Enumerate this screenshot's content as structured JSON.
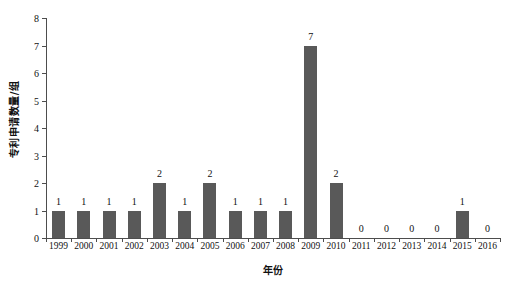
{
  "chart_data": {
    "type": "bar",
    "title": "",
    "xlabel": "年份",
    "ylabel": "专利申请数量/组",
    "categories": [
      "1999",
      "2000",
      "2001",
      "2002",
      "2003",
      "2004",
      "2005",
      "2006",
      "2007",
      "2008",
      "2009",
      "2010",
      "2011",
      "2012",
      "2013",
      "2014",
      "2015",
      "2016"
    ],
    "values": [
      1,
      1,
      1,
      1,
      2,
      1,
      2,
      1,
      1,
      1,
      7,
      2,
      0,
      0,
      0,
      0,
      1,
      0
    ],
    "value_labels": [
      "1",
      "1",
      "1",
      "1",
      "2",
      "1",
      "2",
      "1",
      "1",
      "1",
      "7",
      "2",
      "0",
      "0",
      "0",
      "0",
      "1",
      "0"
    ],
    "ylim": [
      0,
      8
    ],
    "y_ticks": [
      0,
      1,
      2,
      3,
      4,
      5,
      6,
      7,
      8
    ],
    "y_tick_labels": [
      "0",
      "1",
      "2",
      "3",
      "4",
      "5",
      "6",
      "7",
      "8"
    ],
    "grid": false,
    "legend": null,
    "series": [
      {
        "name": "专利申请数量",
        "values": [
          1,
          1,
          1,
          1,
          2,
          1,
          2,
          1,
          1,
          1,
          7,
          2,
          0,
          0,
          0,
          0,
          1,
          0
        ]
      }
    ],
    "colors": {
      "bar": "#595959",
      "axis": "#4d4d4d",
      "text": "#111111",
      "background": "#ffffff"
    }
  }
}
